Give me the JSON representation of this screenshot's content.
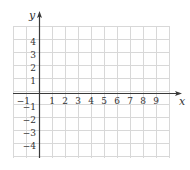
{
  "chart_data": {
    "type": "scatter",
    "title": "",
    "xlabel": "x",
    "ylabel": "y",
    "xlim": [
      -2,
      10
    ],
    "ylim": [
      -5,
      5
    ],
    "grid": true,
    "x_ticks": [
      -1,
      1,
      2,
      3,
      4,
      5,
      6,
      7,
      8,
      9
    ],
    "y_ticks": [
      4,
      3,
      2,
      1,
      -1,
      -2,
      -3,
      -4
    ],
    "x_tick_labels": [
      "−1",
      "1",
      "2",
      "3",
      "4",
      "5",
      "6",
      "7",
      "8",
      "9"
    ],
    "y_tick_labels": [
      "4",
      "3",
      "2",
      "1",
      "−1",
      "−2",
      "−3",
      "−4"
    ],
    "series": [],
    "legend": null
  },
  "colors": {
    "grid": "#d8d8d8",
    "axis": "#3a3a3a",
    "text": "#333333"
  },
  "layout": {
    "origin_px": [
      39,
      93
    ],
    "unit_px": 13,
    "grid_left": 13,
    "grid_right": 169,
    "grid_top": 26,
    "grid_bottom": 158
  }
}
